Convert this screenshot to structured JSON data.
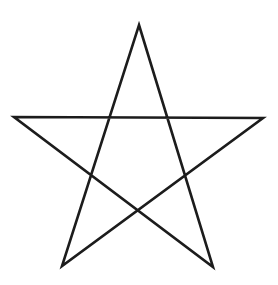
{
  "figure": {
    "background_color": "#ffffff",
    "stroke_color": "#1c1c1c",
    "stroke_width": 2.6,
    "canvas": {
      "width": 278,
      "height": 285
    },
    "star": {
      "vertices": {
        "top": {
          "x": 139,
          "y": 25
        },
        "right": {
          "x": 263,
          "y": 118
        },
        "bottom_right": {
          "x": 213,
          "y": 267
        },
        "bottom_left": {
          "x": 62,
          "y": 266
        },
        "left": {
          "x": 14,
          "y": 117
        }
      },
      "draw_order": [
        "top",
        "bottom_right",
        "left",
        "right",
        "bottom_left"
      ]
    }
  }
}
